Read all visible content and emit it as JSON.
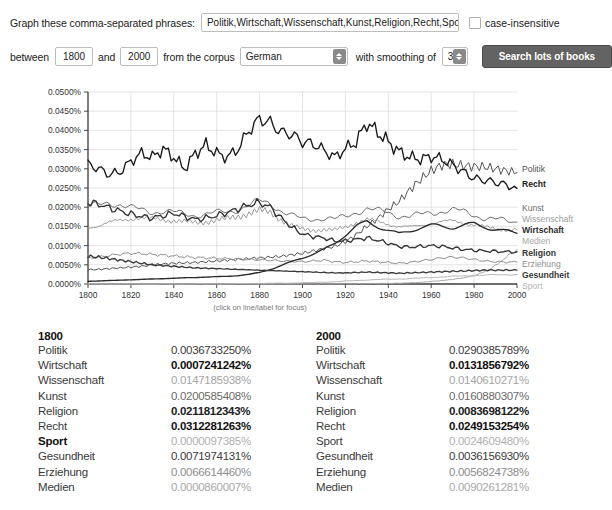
{
  "form": {
    "phrases_label": "Graph these comma-separated phrases:",
    "phrases_value": "Politik,Wirtschaft,Wissenschaft,Kunst,Religion,Recht,Sport,Gesundh",
    "case_insensitive_label": "case-insensitive",
    "case_insensitive_checked": false,
    "between_label": "between",
    "year_start": "1800",
    "and_label": "and",
    "year_end": "2000",
    "corpus_label": "from the corpus",
    "corpus_value": "German",
    "smoothing_label": "with smoothing of",
    "smoothing_value": "3",
    "search_label": "Search lots of books"
  },
  "chart_caption": "(click on line/label for focus)",
  "chart_data": {
    "type": "line",
    "title": "",
    "xlabel": "",
    "ylabel": "",
    "xlim": [
      1800,
      2000
    ],
    "ylim": [
      0.0,
      0.05
    ],
    "grid": true,
    "legend_position": "right",
    "xticks": [
      "1800",
      "1820",
      "1840",
      "1860",
      "1880",
      "1900",
      "1920",
      "1940",
      "1960",
      "1980",
      "2000"
    ],
    "yticks": [
      "0.0000%",
      "0.0050%",
      "0.0100%",
      "0.0150%",
      "0.0200%",
      "0.0250%",
      "0.0300%",
      "0.0350%",
      "0.0400%",
      "0.0450%",
      "0.0500%"
    ],
    "x": [
      1800,
      1805,
      1810,
      1815,
      1820,
      1825,
      1830,
      1835,
      1840,
      1845,
      1850,
      1855,
      1860,
      1865,
      1870,
      1875,
      1880,
      1885,
      1890,
      1895,
      1900,
      1905,
      1910,
      1915,
      1920,
      1925,
      1930,
      1935,
      1940,
      1945,
      1950,
      1955,
      1960,
      1965,
      1970,
      1975,
      1980,
      1985,
      1990,
      1995,
      2000
    ],
    "series": [
      {
        "name": "Recht",
        "color": "#1a1a1a",
        "bold": true,
        "label_y": 187,
        "values": [
          0.0312,
          0.03,
          0.0285,
          0.0292,
          0.032,
          0.034,
          0.033,
          0.0352,
          0.033,
          0.03,
          0.034,
          0.0362,
          0.034,
          0.033,
          0.0352,
          0.04,
          0.043,
          0.042,
          0.0395,
          0.039,
          0.037,
          0.0365,
          0.0348,
          0.033,
          0.0352,
          0.037,
          0.042,
          0.0395,
          0.037,
          0.0345,
          0.033,
          0.0325,
          0.0332,
          0.0325,
          0.031,
          0.0292,
          0.0275,
          0.027,
          0.0265,
          0.0258,
          0.0249
        ]
      },
      {
        "name": "Politik",
        "color": "#555555",
        "bold": false,
        "label_y": 172,
        "values": [
          0.0037,
          0.0038,
          0.004,
          0.0042,
          0.0044,
          0.0046,
          0.005,
          0.0052,
          0.0054,
          0.0055,
          0.0056,
          0.0058,
          0.006,
          0.0062,
          0.0064,
          0.0066,
          0.0068,
          0.007,
          0.0072,
          0.0076,
          0.008,
          0.0086,
          0.0092,
          0.0098,
          0.011,
          0.0128,
          0.015,
          0.017,
          0.0195,
          0.0215,
          0.0245,
          0.0272,
          0.0295,
          0.031,
          0.0312,
          0.0308,
          0.0306,
          0.0305,
          0.03,
          0.0295,
          0.029
        ]
      },
      {
        "name": "Kunst",
        "color": "#6e6e6e",
        "bold": false,
        "label_y": 211,
        "values": [
          0.0201,
          0.0205,
          0.0212,
          0.0208,
          0.0198,
          0.0192,
          0.0188,
          0.019,
          0.0186,
          0.0182,
          0.018,
          0.0182,
          0.0185,
          0.0188,
          0.0195,
          0.0205,
          0.0215,
          0.021,
          0.0192,
          0.0178,
          0.0168,
          0.017,
          0.0172,
          0.0168,
          0.0175,
          0.0188,
          0.0196,
          0.019,
          0.0186,
          0.0178,
          0.0176,
          0.018,
          0.0186,
          0.019,
          0.0192,
          0.0188,
          0.018,
          0.0172,
          0.0168,
          0.0164,
          0.0161
        ]
      },
      {
        "name": "Wissenschaft",
        "color": "#9a9a9a",
        "bold": false,
        "label_y": 222,
        "values": [
          0.0147,
          0.0152,
          0.016,
          0.0166,
          0.017,
          0.0172,
          0.017,
          0.0168,
          0.0165,
          0.0162,
          0.016,
          0.0162,
          0.0166,
          0.017,
          0.0176,
          0.0184,
          0.0192,
          0.0186,
          0.0168,
          0.0152,
          0.0142,
          0.014,
          0.0142,
          0.014,
          0.0148,
          0.016,
          0.0168,
          0.0162,
          0.0156,
          0.015,
          0.0148,
          0.0152,
          0.0158,
          0.0162,
          0.0164,
          0.016,
          0.0154,
          0.0148,
          0.0144,
          0.0142,
          0.0141
        ]
      },
      {
        "name": "Wirtschaft",
        "color": "#2a2a2a",
        "bold": true,
        "label_y": 233,
        "values": [
          0.0007,
          0.0008,
          0.0009,
          0.001,
          0.0011,
          0.0012,
          0.0013,
          0.0014,
          0.0015,
          0.0016,
          0.0017,
          0.0018,
          0.0019,
          0.002,
          0.0022,
          0.0025,
          0.003,
          0.0038,
          0.0048,
          0.0058,
          0.0068,
          0.0078,
          0.009,
          0.0105,
          0.0128,
          0.015,
          0.0162,
          0.015,
          0.014,
          0.013,
          0.0138,
          0.0148,
          0.0152,
          0.015,
          0.0148,
          0.0152,
          0.0156,
          0.015,
          0.0142,
          0.0136,
          0.0132
        ]
      },
      {
        "name": "Medien",
        "color": "#a8a8a8",
        "bold": false,
        "label_y": 244,
        "values": [
          1e-05,
          1e-05,
          1e-05,
          1e-05,
          1e-05,
          1e-05,
          1e-05,
          1e-05,
          1e-05,
          1e-05,
          1e-05,
          1e-05,
          1e-05,
          1e-05,
          1e-05,
          1e-05,
          1e-05,
          1e-05,
          1e-05,
          1e-05,
          2e-05,
          2e-05,
          3e-05,
          4e-05,
          5e-05,
          7e-05,
          0.0001,
          0.00013,
          0.00016,
          0.0002,
          0.0003,
          0.00045,
          0.00065,
          0.0009,
          0.0012,
          0.0016,
          0.0022,
          0.0032,
          0.0048,
          0.007,
          0.00903
        ]
      },
      {
        "name": "Religion",
        "color": "#333333",
        "bold": true,
        "label_y": 256,
        "values": [
          0.0212,
          0.0208,
          0.0198,
          0.019,
          0.0182,
          0.0176,
          0.0172,
          0.0178,
          0.0184,
          0.0176,
          0.0168,
          0.0172,
          0.0178,
          0.0186,
          0.0196,
          0.0206,
          0.0212,
          0.02,
          0.0172,
          0.0148,
          0.013,
          0.0124,
          0.012,
          0.0112,
          0.0112,
          0.0116,
          0.012,
          0.0114,
          0.0106,
          0.0098,
          0.0096,
          0.0098,
          0.01,
          0.0098,
          0.0094,
          0.009,
          0.0088,
          0.0086,
          0.0085,
          0.0084,
          0.0084
        ]
      },
      {
        "name": "Erziehung",
        "color": "#8f8f8f",
        "bold": false,
        "label_y": 267,
        "values": [
          0.0067,
          0.007,
          0.0074,
          0.0078,
          0.008,
          0.0079,
          0.0077,
          0.0075,
          0.0073,
          0.0071,
          0.0069,
          0.0068,
          0.0067,
          0.0066,
          0.0065,
          0.0064,
          0.0063,
          0.0062,
          0.006,
          0.0059,
          0.0058,
          0.006,
          0.0062,
          0.0058,
          0.0056,
          0.0058,
          0.006,
          0.0058,
          0.0056,
          0.0054,
          0.0056,
          0.006,
          0.0064,
          0.0068,
          0.007,
          0.0068,
          0.0064,
          0.006,
          0.0058,
          0.0057,
          0.0057
        ]
      },
      {
        "name": "Gesundheit",
        "color": "#3a3a3a",
        "bold": true,
        "label_y": 278,
        "values": [
          0.0072,
          0.007,
          0.0066,
          0.0062,
          0.0058,
          0.0054,
          0.005,
          0.0048,
          0.0046,
          0.0044,
          0.0042,
          0.0041,
          0.004,
          0.0039,
          0.0038,
          0.0037,
          0.0036,
          0.0035,
          0.0034,
          0.0033,
          0.0032,
          0.0031,
          0.003,
          0.0029,
          0.0029,
          0.003,
          0.0031,
          0.003,
          0.0029,
          0.0028,
          0.0029,
          0.003,
          0.0031,
          0.0032,
          0.0033,
          0.0034,
          0.0035,
          0.0036,
          0.0036,
          0.0036,
          0.0036
        ]
      },
      {
        "name": "Sport",
        "color": "#b5b5b5",
        "bold": false,
        "label_y": 289,
        "values": [
          9.7e-06,
          1e-05,
          1e-05,
          1e-05,
          1e-05,
          1e-05,
          2e-05,
          2e-05,
          2e-05,
          3e-05,
          3e-05,
          4e-05,
          5e-05,
          6e-05,
          8e-05,
          0.0001,
          0.00013,
          0.00016,
          0.0002,
          0.00025,
          0.00032,
          0.0004,
          0.0005,
          0.0006,
          0.00075,
          0.0009,
          0.00105,
          0.00115,
          0.00125,
          0.0013,
          0.0014,
          0.00155,
          0.0017,
          0.00185,
          0.002,
          0.0021,
          0.0022,
          0.0023,
          0.00238,
          0.00243,
          0.00246
        ]
      }
    ]
  },
  "tables": [
    {
      "year": "1800",
      "rows": [
        {
          "term": "Politik",
          "value": "0.0036733250%",
          "term_bold": false,
          "value_bold": false,
          "value_color": "#3b3b3b"
        },
        {
          "term": "Wirtschaft",
          "value": "0.0007241242%",
          "term_bold": false,
          "value_bold": true,
          "value_color": "#111111"
        },
        {
          "term": "Wissenschaft",
          "value": "0.0147185938%",
          "term_bold": false,
          "value_bold": false,
          "value_color": "#a5a5a5"
        },
        {
          "term": "Kunst",
          "value": "0.0200585408%",
          "term_bold": false,
          "value_bold": false,
          "value_color": "#6b6b6b"
        },
        {
          "term": "Religion",
          "value": "0.0211812343%",
          "term_bold": false,
          "value_bold": true,
          "value_color": "#222222"
        },
        {
          "term": "Recht",
          "value": "0.0312281263%",
          "term_bold": false,
          "value_bold": true,
          "value_color": "#111111"
        },
        {
          "term": "Sport",
          "value": "0.0000097385%",
          "term_bold": true,
          "value_bold": false,
          "value_color": "#b0b0b0"
        },
        {
          "term": "Gesundheit",
          "value": "0.0071974131%",
          "term_bold": false,
          "value_bold": false,
          "value_color": "#3b3b3b"
        },
        {
          "term": "Erziehung",
          "value": "0.0066614460%",
          "term_bold": false,
          "value_bold": false,
          "value_color": "#8c8c8c"
        },
        {
          "term": "Medien",
          "value": "0.0000860007%",
          "term_bold": false,
          "value_bold": false,
          "value_color": "#a8a8a8"
        }
      ]
    },
    {
      "year": "2000",
      "rows": [
        {
          "term": "Politik",
          "value": "0.0290385789%",
          "term_bold": false,
          "value_bold": false,
          "value_color": "#3b3b3b"
        },
        {
          "term": "Wirtschaft",
          "value": "0.0131856792%",
          "term_bold": false,
          "value_bold": true,
          "value_color": "#111111"
        },
        {
          "term": "Wissenschaft",
          "value": "0.0140610271%",
          "term_bold": false,
          "value_bold": false,
          "value_color": "#a5a5a5"
        },
        {
          "term": "Kunst",
          "value": "0.0160880307%",
          "term_bold": false,
          "value_bold": false,
          "value_color": "#6b6b6b"
        },
        {
          "term": "Religion",
          "value": "0.0083698122%",
          "term_bold": false,
          "value_bold": true,
          "value_color": "#222222"
        },
        {
          "term": "Recht",
          "value": "0.0249153254%",
          "term_bold": false,
          "value_bold": true,
          "value_color": "#111111"
        },
        {
          "term": "Sport",
          "value": "0.0024609480%",
          "term_bold": false,
          "value_bold": false,
          "value_color": "#b0b0b0"
        },
        {
          "term": "Gesundheit",
          "value": "0.0036156930%",
          "term_bold": false,
          "value_bold": false,
          "value_color": "#3b3b3b"
        },
        {
          "term": "Erziehung",
          "value": "0.0056824738%",
          "term_bold": false,
          "value_bold": false,
          "value_color": "#8c8c8c"
        },
        {
          "term": "Medien",
          "value": "0.0090261281%",
          "term_bold": false,
          "value_bold": false,
          "value_color": "#a8a8a8"
        }
      ]
    }
  ]
}
